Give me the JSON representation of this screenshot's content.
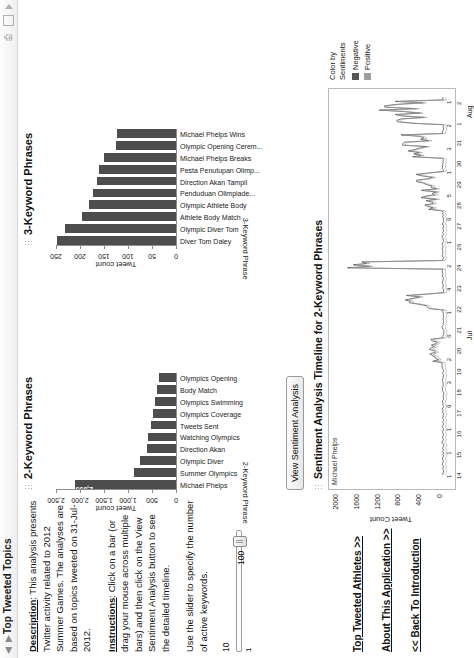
{
  "window": {
    "title": "Top Tweeted Topics",
    "nav_back_icon": "left-arrow-icon",
    "nav_forward_icon": "right-arrow-icon",
    "print_icon": "print-icon",
    "window_icon": "window-icon",
    "flag_icon": "flag-icon"
  },
  "sidebar": {
    "description_label": "Description",
    "description_text": ": This analysis presents Twitter activity related to 2012 Summer Games. The analyses are based on topics tweeted on 31-Jul-2012.",
    "instructions_label": "Instructions",
    "instructions_text": ": Click on a bar (or drag your mouse across multiple bars) and then click on the View Sentiment Analysis button to see the detailed timeline.",
    "slider_help": "Use the slider to specify the number of active keywords.",
    "slider_min": "1",
    "slider_max": "100",
    "slider_value": "10",
    "links": [
      {
        "label": "Top Tweeted Athletes >>",
        "name": "top-tweeted-athletes-link"
      },
      {
        "label": "About This Application >>",
        "name": "about-application-link"
      },
      {
        "label": "<< Back To Introduction",
        "name": "back-to-introduction-link"
      }
    ]
  },
  "buttons": {
    "view_sentiment": "View Sentiment Analysis"
  },
  "chart_data": [
    {
      "type": "bar",
      "title": "2-Keyword Phrases",
      "xlabel": "Tweet count",
      "ylabel": "2-Keyword Phrase",
      "orientation": "vertical",
      "xlim": [
        0,
        2500
      ],
      "ticks": [
        "0",
        "500",
        "1,000",
        "1,500",
        "2,000",
        "2,500"
      ],
      "grid": false,
      "categories": [
        "Michael Phelps",
        "Summer Olympics",
        "Olympic Diver",
        "Direction Akan",
        "Watching Olympics",
        "Tweets Sent",
        "Olympics Coverage",
        "Olympics Swimming",
        "Body Match",
        "Olympics Opening"
      ],
      "values": [
        2095,
        870,
        760,
        610,
        585,
        520,
        470,
        430,
        400,
        360
      ],
      "annotations": [
        {
          "category": "Michael Phelps",
          "label": "2,095"
        }
      ]
    },
    {
      "type": "bar",
      "title": "3-Keyword Phrases",
      "xlabel": "Tweet count",
      "ylabel": "3-Keyword Phrase",
      "orientation": "vertical",
      "xlim": [
        0,
        250
      ],
      "ticks": [
        "0",
        "50",
        "100",
        "150",
        "200",
        "250"
      ],
      "grid": false,
      "categories": [
        "Diver Tom Daley",
        "Olympic Diver Tom",
        "Athlete Body Match",
        "Olympic Athlete Body",
        "Penduduan Olimpiade...",
        "Direction Akan Tampil",
        "Pesta Penutupan Olimp...",
        "Michael Phelps Breaks",
        "Olympic Opening Cerem...",
        "Michael Phelps Wins"
      ],
      "values": [
        248,
        232,
        196,
        182,
        172,
        164,
        160,
        150,
        126,
        122
      ],
      "annotations": []
    },
    {
      "type": "line",
      "title": "Sentiment Analysis Timeline for 2-Keyword Phrases",
      "series_label": "Michael Phelps",
      "ylabel": "Tweet Count",
      "ylim": [
        0,
        2000
      ],
      "yticks": [
        "2000",
        "1600",
        "1200",
        "800",
        "400",
        "0"
      ],
      "xticks_day": [
        "1",
        "7",
        "7",
        "6",
        "4",
        "3",
        "2",
        "6",
        "4",
        "8",
        "7",
        "6",
        "5",
        "4",
        "10",
        "9",
        "8",
        "7"
      ],
      "xticks_date": [
        "14",
        "15",
        "16",
        "17",
        "18",
        "19",
        "20",
        "21",
        "22",
        "23",
        "24",
        "26",
        "27",
        "28",
        "29",
        "30",
        "31",
        "1",
        "2"
      ],
      "xtick_extra": [
        "1",
        "1",
        "1",
        "9",
        "3",
        "2",
        "6",
        "1",
        "4",
        "2",
        "1",
        "6",
        "5",
        "1",
        "3",
        "2",
        "1"
      ],
      "months": [
        "Jul",
        "Aug"
      ],
      "year": "2012",
      "legend_title": "Color by Sentiments",
      "legend": [
        {
          "label": "Negative",
          "color": "#555555"
        },
        {
          "label": "Positive",
          "color": "#9e9e9e"
        }
      ],
      "legend_position": "right"
    }
  ],
  "colors": {
    "bar": "#4d4d4d",
    "negative": "#555555",
    "positive": "#9e9e9e",
    "axis": "#8d8d8d"
  }
}
